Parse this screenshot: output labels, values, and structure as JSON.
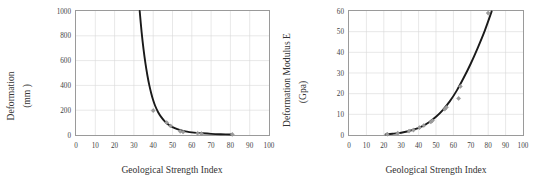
{
  "figure": {
    "panels": [
      "left",
      "right"
    ]
  },
  "chart_data": [
    {
      "id": "deformation-vs-gsi",
      "type": "line",
      "title": "",
      "xlabel": "Geological Strength Index",
      "ylabel": "Deformation (mm )",
      "ylabel_line1": "Deformation",
      "ylabel_line2": "(mm )",
      "xlim": [
        0,
        100
      ],
      "ylim": [
        0,
        1000
      ],
      "xticks": [
        0,
        10,
        20,
        30,
        40,
        50,
        60,
        70,
        80,
        90,
        100
      ],
      "xtick_labels": [
        "0",
        "10",
        "20",
        "30",
        "40",
        "50",
        "60",
        "70",
        "80",
        "90",
        "100"
      ],
      "yticks": [
        0,
        200,
        400,
        600,
        800,
        1000
      ],
      "ytick_labels": [
        "0",
        "200",
        "400",
        "600",
        "800",
        "1000"
      ],
      "grid": true,
      "legend": "none",
      "series": [
        {
          "name": "fitted-curve",
          "kind": "line",
          "color": "#1a1a1a",
          "x": [
            33.0,
            34.0,
            35.0,
            36.0,
            37.0,
            38.0,
            39.0,
            40.0,
            41.0,
            42.5,
            44.0,
            46.0,
            48.0,
            50.0,
            52.5,
            55.0,
            57.5,
            60.0,
            62.5,
            65.0,
            70.0,
            75.0,
            81.0
          ],
          "y": [
            1000,
            830,
            690,
            575,
            480,
            400,
            335,
            280,
            236,
            186,
            148,
            110,
            83,
            64,
            47,
            35,
            27,
            21,
            17,
            14,
            9,
            6,
            4
          ]
        },
        {
          "name": "measured-points",
          "kind": "scatter",
          "color": "#9c9c9c",
          "x": [
            40.0,
            47.0,
            49.0,
            54.0,
            55.5,
            63.0,
            65.0,
            81.0
          ],
          "y": [
            197,
            100,
            73,
            30,
            24,
            14,
            11,
            5
          ]
        }
      ]
    },
    {
      "id": "deformation-modulus-vs-gsi",
      "type": "line",
      "title": "",
      "xlabel": "Geological Strength Index",
      "ylabel": "Deformation Modulus E (Gpa)",
      "ylabel_line1": "Deformation Modulus E",
      "ylabel_line2": "(Gpa)",
      "xlim": [
        0,
        100
      ],
      "ylim": [
        0,
        60
      ],
      "xticks": [
        0,
        10,
        20,
        30,
        40,
        50,
        60,
        70,
        80,
        90,
        100
      ],
      "xtick_labels": [
        "0",
        "10",
        "20",
        "30",
        "40",
        "50",
        "60",
        "70",
        "80",
        "90",
        "100"
      ],
      "yticks": [
        0,
        10,
        20,
        30,
        40,
        50,
        60
      ],
      "ytick_labels": [
        "0",
        "10",
        "20",
        "30",
        "40",
        "50",
        "60"
      ],
      "grid": true,
      "legend": "none",
      "series": [
        {
          "name": "fitted-curve",
          "kind": "line",
          "color": "#1a1a1a",
          "x": [
            21.0,
            25.0,
            30.0,
            34.0,
            38.0,
            42.0,
            46.0,
            50.0,
            54.0,
            58.0,
            62.0,
            66.0,
            70.0,
            74.0,
            78.0,
            82.0
          ],
          "y": [
            0.3,
            0.6,
            1.1,
            1.8,
            2.8,
            4.2,
            6.2,
            8.8,
            12.2,
            16.4,
            21.6,
            27.8,
            34.6,
            42.2,
            50.4,
            59.8
          ]
        },
        {
          "name": "measured-points",
          "kind": "scatter",
          "color": "#9c9c9c",
          "x": [
            22.0,
            28.0,
            34.5,
            37.0,
            40.5,
            43.0,
            47.0,
            48.0,
            55.0,
            56.0,
            63.0,
            64.0,
            80.0
          ],
          "y": [
            0.4,
            0.9,
            1.9,
            2.4,
            3.6,
            4.6,
            6.3,
            7.0,
            12.5,
            13.4,
            17.7,
            23.5,
            59.0
          ]
        }
      ]
    }
  ]
}
